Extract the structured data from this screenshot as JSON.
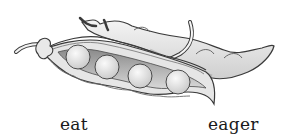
{
  "figure": {
    "labels": [
      {
        "text": "eat"
      },
      {
        "text": "eager"
      }
    ],
    "colors": {
      "ink": "#3a3a3a",
      "pod_fill": "#ececec",
      "shadow": "#b8b8b8",
      "pea_fill": "#f2f2f2",
      "background": "#ffffff"
    },
    "pea_count": 4
  }
}
